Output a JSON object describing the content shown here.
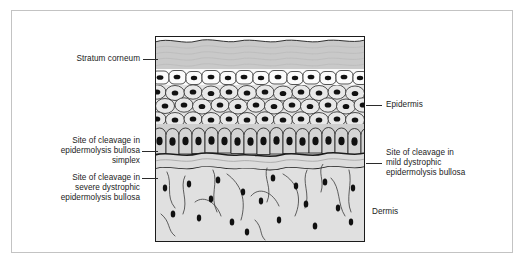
{
  "figure": {
    "type": "anatomical-cross-section"
  },
  "labels": {
    "stratum_corneum": "Stratum corneum",
    "epidermis": "Epidermis",
    "dermis": "Dermis",
    "cleavage_simplex": "Site of cleavage in\nepidermolysis bullosa\nsimplex",
    "cleavage_severe_dystrophic": "Site of cleavage in\nsevere dystrophic\nepidermolysis bullosa",
    "cleavage_mild_dystrophic": "Site of cleavage in\nmild dystrophic\nepidermolysis bullosa"
  },
  "colors": {
    "stratum_corneum_fill": "#c9c9c9",
    "granular_cell_fill": "#fbfbfb",
    "spinous_cell_fill": "#e3e3e3",
    "basal_cell_fill": "#cfcfcf",
    "lamina_fill": "#dcdcdc",
    "dermis_fill": "#e0e0e0",
    "nucleus_fill": "#111111",
    "outline": "#1b1b1b",
    "frame_border": "#c3c3c3",
    "leader_line": "#2b2b2b",
    "text": "#1b1b1b",
    "page_background": "#ffffff"
  }
}
